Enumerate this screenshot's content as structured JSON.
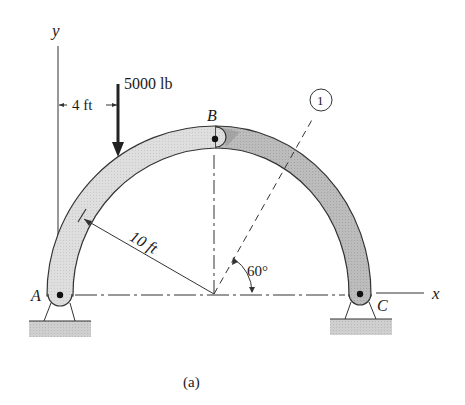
{
  "figure": {
    "caption": "(a)",
    "axes": {
      "x_label": "x",
      "y_label": "y"
    },
    "points": {
      "A": "A",
      "B": "B",
      "C": "C"
    },
    "load": {
      "label": "5000 lb",
      "magnitude": 5000,
      "unit": "lb",
      "direction": "down"
    },
    "dimensions": {
      "load_offset": "4 ft",
      "radius": "10 ft"
    },
    "section": {
      "marker": "1",
      "angle_label": "60°",
      "angle_deg": 60
    },
    "colors": {
      "left_member": "#d9d9d9",
      "right_member": "#bdbdbd",
      "outline": "#333333",
      "support_base": "#c8c8c8"
    }
  }
}
